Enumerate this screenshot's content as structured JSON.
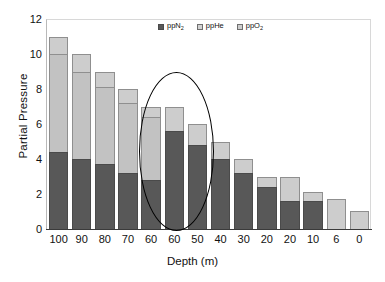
{
  "chart_data": {
    "type": "bar",
    "stacked": true,
    "title": "",
    "xlabel": "Depth (m)",
    "ylabel": "Partial Pressure",
    "categories": [
      "100",
      "90",
      "80",
      "70",
      "60",
      "60",
      "50",
      "40",
      "30",
      "20",
      "20",
      "10",
      "6",
      "0"
    ],
    "ylim": [
      0,
      12
    ],
    "yticks": [
      12,
      10,
      8,
      6,
      4,
      2,
      0
    ],
    "grid": false,
    "legend_position": "top-center",
    "series": [
      {
        "name": "ppN2",
        "label": "ppN",
        "sub": "2",
        "color": "#585858",
        "values": [
          4.4,
          4.0,
          3.7,
          3.2,
          2.8,
          5.6,
          4.8,
          4.0,
          3.2,
          2.4,
          1.6,
          1.6,
          0.0,
          0.0
        ]
      },
      {
        "name": "ppHe",
        "label": "ppHe",
        "sub": "",
        "color": "#c2c2c2",
        "values": [
          5.6,
          5.0,
          4.4,
          4.0,
          3.6,
          0.0,
          0.0,
          0.0,
          0.0,
          0.0,
          0.0,
          0.0,
          0.0,
          0.0
        ]
      },
      {
        "name": "ppO2",
        "label": "ppO",
        "sub": "2",
        "color": "#cdcdcd",
        "values": [
          1.0,
          1.0,
          0.9,
          0.8,
          0.6,
          1.4,
          1.2,
          1.0,
          0.8,
          0.6,
          1.4,
          0.5,
          1.7,
          1.05
        ]
      }
    ],
    "totals": [
      11.0,
      10.0,
      9.0,
      8.0,
      7.0,
      7.0,
      6.0,
      5.0,
      4.0,
      3.0,
      3.0,
      2.1,
      1.7,
      1.05
    ],
    "annotations": [
      {
        "type": "ellipse",
        "note": "highlight on the 60 m / 60 m / 50 m gas-switch bars",
        "covers": [
          "60",
          "60",
          "50"
        ]
      }
    ]
  },
  "legend": {
    "items": [
      {
        "key": "ppN2",
        "text": "ppN",
        "sub": "2"
      },
      {
        "key": "ppHe",
        "text": "ppHe",
        "sub": ""
      },
      {
        "key": "ppO2",
        "text": "ppO",
        "sub": "2"
      }
    ]
  },
  "axis": {
    "y_title": "Partial Pressure",
    "x_title": "Depth (m)",
    "y_tick_labels": [
      "12",
      "10",
      "8",
      "6",
      "4",
      "2",
      "0"
    ]
  },
  "colors": {
    "ppN2": "#585858",
    "ppHe": "#c2c2c2",
    "ppO2": "#cdcdcd",
    "axis": "#3a3a3a",
    "annotation": "#000000",
    "background": "#ffffff"
  }
}
